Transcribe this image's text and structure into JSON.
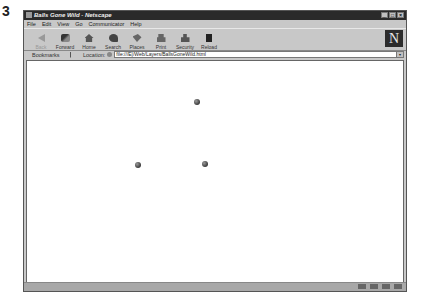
{
  "figure_label": "3",
  "window": {
    "title": "Balls Gone Wild - Netscape",
    "buttons": {
      "minimize": "_",
      "maximize": "□",
      "close": "×"
    }
  },
  "menubar": {
    "items": [
      {
        "label": "File"
      },
      {
        "label": "Edit"
      },
      {
        "label": "View"
      },
      {
        "label": "Go"
      },
      {
        "label": "Communicator"
      },
      {
        "label": "Help"
      }
    ]
  },
  "toolbar": {
    "buttons": [
      {
        "label": "Back",
        "icon": "back-arrow-icon",
        "disabled": true
      },
      {
        "label": "Forward",
        "icon": "forward-arrow-icon"
      },
      {
        "label": "Home",
        "icon": "home-icon"
      },
      {
        "label": "Search",
        "icon": "search-icon"
      },
      {
        "label": "Places",
        "icon": "places-icon"
      },
      {
        "label": "Print",
        "icon": "print-icon"
      },
      {
        "label": "Security",
        "icon": "security-lock-icon"
      },
      {
        "label": "Reload",
        "icon": "reload-icon"
      }
    ],
    "logo": "N"
  },
  "location_bar": {
    "bookmarks_label": "Bookmarks",
    "location_label": "Location:",
    "url": "file:///E|/Web/Layers/BallsGoneWild.html"
  },
  "content": {
    "balls": [
      {
        "x": 167,
        "y": 38
      },
      {
        "x": 108,
        "y": 101
      },
      {
        "x": 175,
        "y": 100
      }
    ],
    "ball_color": "#3a3a3a"
  },
  "status_bar": {
    "text": "",
    "icons": [
      "component-bar-icon",
      "mail-icon",
      "discussion-icon",
      "composer-icon"
    ]
  }
}
